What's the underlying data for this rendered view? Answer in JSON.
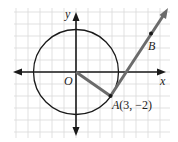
{
  "diagram": {
    "type": "coordinate-geometry",
    "labels": {
      "x_axis": "x",
      "y_axis": "y",
      "origin": "O",
      "point_a": "A",
      "point_a_coords": "(3, −2)",
      "point_b": "B"
    },
    "points": {
      "O": [
        0,
        0
      ],
      "A": [
        3,
        -2
      ]
    },
    "circle": {
      "center": [
        0,
        0
      ],
      "radius_squared": 13
    },
    "tangent_direction": [
      2,
      3
    ],
    "colors": {
      "grid": "#d9d9d9",
      "axis": "#1a1a1a",
      "circle": "#1a1a1a",
      "segment_gray": "#6b6b6b",
      "point": "#1a1a1a",
      "background": "#ffffff"
    }
  }
}
